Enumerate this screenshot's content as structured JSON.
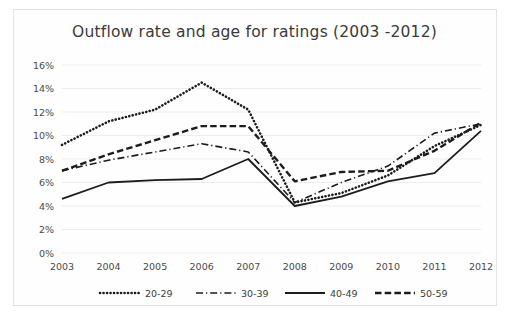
{
  "chart_data": {
    "type": "line",
    "title": "Outflow rate and age  for ratings (2003 -2012)",
    "xlabel": "",
    "ylabel": "",
    "x": [
      "2003",
      "2004",
      "2005",
      "2006",
      "2007",
      "2008",
      "2009",
      "2010",
      "2011",
      "2012"
    ],
    "categories": [
      "2003",
      "2004",
      "2005",
      "2006",
      "2007",
      "2008",
      "2009",
      "2010",
      "2011",
      "2012"
    ],
    "ylim": [
      0,
      16
    ],
    "ytick_labels": [
      "0%",
      "2%",
      "4%",
      "6%",
      "8%",
      "10%",
      "12%",
      "14%",
      "16%"
    ],
    "ytick_values": [
      0,
      2,
      4,
      6,
      8,
      10,
      12,
      14,
      16
    ],
    "grid": true,
    "legend_position": "bottom",
    "units": "percent",
    "series": [
      {
        "name": "20-29",
        "style": "dotted",
        "values": [
          9.2,
          11.2,
          12.2,
          14.5,
          12.2,
          4.3,
          5.1,
          6.6,
          9.1,
          10.9
        ]
      },
      {
        "name": "30-39",
        "style": "dash-dot",
        "values": [
          7.0,
          7.9,
          8.6,
          9.3,
          8.6,
          4.3,
          6.0,
          7.4,
          10.2,
          11.0
        ]
      },
      {
        "name": "40-49",
        "style": "solid",
        "values": [
          4.6,
          6.0,
          6.2,
          6.3,
          8.0,
          4.0,
          4.8,
          6.1,
          6.8,
          10.4
        ]
      },
      {
        "name": "50-59",
        "style": "dashed",
        "values": [
          7.0,
          8.4,
          9.6,
          10.8,
          10.8,
          6.1,
          6.9,
          7.0,
          8.7,
          11.1
        ]
      }
    ]
  },
  "legend": {
    "items": [
      {
        "label": "20-29"
      },
      {
        "label": "30-39"
      },
      {
        "label": "40-49"
      },
      {
        "label": "50-59"
      }
    ]
  }
}
